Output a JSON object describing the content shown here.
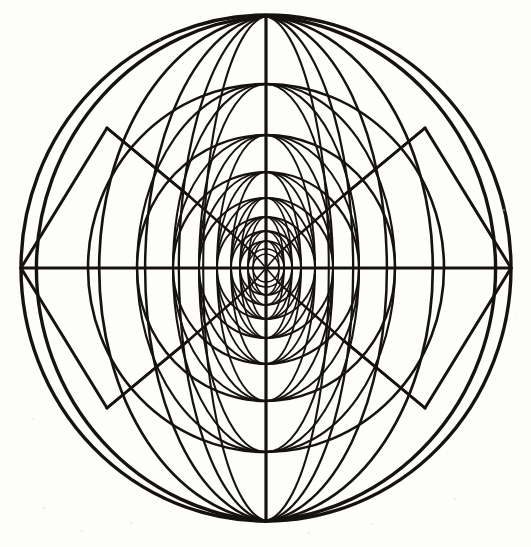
{
  "figure": {
    "medium": "engraving",
    "caption": ""
  },
  "canvas": {
    "width": 531,
    "height": 547,
    "background_color": "#fdfdfc",
    "ink_color": "#16120f"
  },
  "chart_data": {
    "type": "diagram",
    "center": {
      "x": 266,
      "y": 268
    },
    "poles": {
      "north": {
        "x": 266,
        "y": 16
      },
      "south": {
        "x": 266,
        "y": 521
      }
    },
    "equator_endpoints": {
      "west": {
        "x": 21,
        "y": 268
      },
      "east": {
        "x": 511,
        "y": 268
      }
    },
    "outer_ellipse": {
      "rx": 245,
      "ry": 253
    },
    "parallel_ellipses": [
      {
        "index": 1,
        "rx": 245,
        "ry": 253,
        "stroke": 3.4
      },
      {
        "index": 2,
        "rx": 178,
        "ry": 184,
        "stroke": 2.6
      },
      {
        "index": 3,
        "rx": 129,
        "ry": 133,
        "stroke": 2.4
      },
      {
        "index": 4,
        "rx": 93,
        "ry": 96,
        "stroke": 2.2
      },
      {
        "index": 5,
        "rx": 67,
        "ry": 70,
        "stroke": 2.0
      },
      {
        "index": 6,
        "rx": 49,
        "ry": 51,
        "stroke": 1.9
      },
      {
        "index": 7,
        "rx": 35,
        "ry": 37,
        "stroke": 1.8
      },
      {
        "index": 8,
        "rx": 26,
        "ry": 27,
        "stroke": 1.7
      },
      {
        "index": 9,
        "rx": 18,
        "ry": 19,
        "stroke": 1.6
      },
      {
        "index": 10,
        "rx": 13,
        "ry": 14,
        "stroke": 1.5
      }
    ],
    "meridian_half_widths": [
      245,
      178,
      129,
      93,
      67,
      49,
      35,
      26,
      18,
      13
    ],
    "meridian_count": 18,
    "axes": [
      {
        "name": "equator",
        "orientation": "horizontal",
        "stroke": 3.0
      },
      {
        "name": "polar-axis",
        "orientation": "vertical",
        "stroke": 3.0
      }
    ],
    "diagonal_chords": {
      "count": 8,
      "description": "straight lines joining latitude/meridian crossing nodes in each quadrant"
    },
    "legend": [],
    "annotations": [],
    "grid": true
  }
}
